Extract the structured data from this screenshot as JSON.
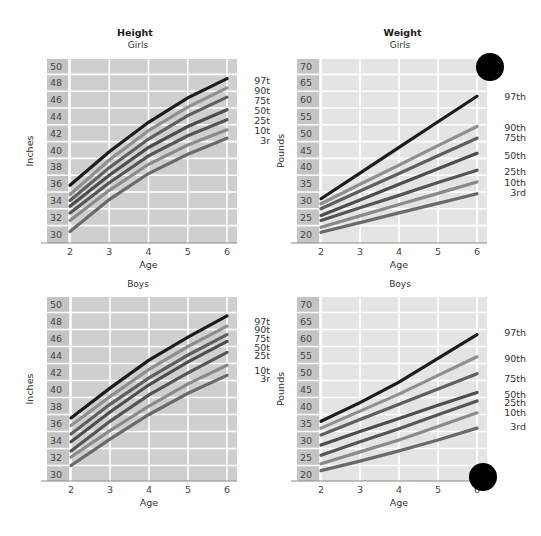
{
  "headers": {
    "height_title": "Height",
    "weight_title": "Weight"
  },
  "chart_data": [
    {
      "id": "girls-height",
      "type": "line",
      "title": "Height",
      "subtitle": "Girls",
      "xlabel": "Age",
      "ylabel": "Inches",
      "x": [
        2,
        3,
        4,
        5,
        6
      ],
      "xticks": [
        2,
        3,
        4,
        5,
        6
      ],
      "yticks": [
        30,
        32,
        34,
        36,
        38,
        40,
        42,
        44,
        46,
        48,
        50
      ],
      "ylim": [
        30,
        50
      ],
      "xlim": [
        2,
        6
      ],
      "grid": true,
      "legend_position": "right",
      "bg": "#cfcfcf",
      "series": [
        {
          "name": "97th",
          "values": [
            35.8,
            39.8,
            43.3,
            46.2,
            48.5
          ],
          "color": "#1c1c1c"
        },
        {
          "name": "90th",
          "values": [
            34.7,
            38.8,
            42.3,
            45.1,
            47.4
          ],
          "color": "#8f8f8f"
        },
        {
          "name": "75th",
          "values": [
            34.0,
            37.9,
            41.3,
            44.1,
            46.3
          ],
          "color": "#5f5f5f"
        },
        {
          "name": "50th",
          "values": [
            33.3,
            37.0,
            40.3,
            42.8,
            44.8
          ],
          "color": "#4d4d4d"
        },
        {
          "name": "25th",
          "values": [
            32.5,
            36.1,
            39.3,
            41.7,
            43.6
          ],
          "color": "#555555"
        },
        {
          "name": "10th",
          "values": [
            31.6,
            35.2,
            38.3,
            40.6,
            42.4
          ],
          "color": "#8a8a8a"
        },
        {
          "name": "3rd",
          "values": [
            30.3,
            34.1,
            37.2,
            39.5,
            41.4
          ],
          "color": "#6a6a6a"
        }
      ],
      "legend_label_y": [
        48.3,
        47.1,
        45.9,
        44.7,
        43.5,
        42.3,
        41.1
      ]
    },
    {
      "id": "girls-weight",
      "type": "line",
      "title": "Weight",
      "subtitle": "Girls",
      "xlabel": "Age",
      "ylabel": "Pounds",
      "x": [
        2,
        3,
        4,
        5,
        6
      ],
      "xticks": [
        2,
        3,
        4,
        5,
        6
      ],
      "yticks": [
        20,
        25,
        30,
        35,
        40,
        45,
        50,
        55,
        60,
        65,
        70
      ],
      "ylim": [
        20,
        70
      ],
      "xlim": [
        2,
        6
      ],
      "grid": true,
      "legend_position": "right",
      "bg": "#e4e4e4",
      "series": [
        {
          "name": "97th",
          "values": [
            30.5,
            38.1,
            45.8,
            53.4,
            61.0
          ],
          "color": "#1c1c1c"
        },
        {
          "name": "90th",
          "values": [
            29.0,
            34.8,
            40.5,
            46.3,
            52.0
          ],
          "color": "#8f8f8f"
        },
        {
          "name": "75th",
          "values": [
            27.5,
            32.8,
            38.0,
            43.3,
            48.5
          ],
          "color": "#5f5f5f"
        },
        {
          "name": "50th",
          "values": [
            25.5,
            30.1,
            34.8,
            39.4,
            44.0
          ],
          "color": "#4d4d4d"
        },
        {
          "name": "25th",
          "values": [
            24.0,
            27.8,
            31.5,
            35.3,
            39.0
          ],
          "color": "#555555"
        },
        {
          "name": "10th",
          "values": [
            22.0,
            25.4,
            28.8,
            32.1,
            35.5
          ],
          "color": "#8a8a8a"
        },
        {
          "name": "3rd",
          "values": [
            20.5,
            23.4,
            26.3,
            29.1,
            32.0
          ],
          "color": "#6a6a6a"
        }
      ],
      "legend_label_y": [
        61.0,
        51.6,
        48.6,
        43.4,
        38.6,
        35.4,
        32.4
      ]
    },
    {
      "id": "boys-height",
      "type": "line",
      "title": "",
      "subtitle": "Boys",
      "xlabel": "Age",
      "ylabel": "Inches",
      "x": [
        2,
        3,
        4,
        5,
        6
      ],
      "xticks": [
        2,
        3,
        4,
        5,
        6
      ],
      "yticks": [
        30,
        32,
        34,
        36,
        38,
        40,
        42,
        44,
        46,
        48,
        50
      ],
      "ylim": [
        30,
        50
      ],
      "xlim": [
        2,
        6
      ],
      "grid": true,
      "legend_position": "right",
      "bg": "#cfcfcf",
      "series": [
        {
          "name": "97th",
          "values": [
            36.6,
            40.1,
            43.4,
            46.1,
            48.6
          ],
          "color": "#1c1c1c"
        },
        {
          "name": "90th",
          "values": [
            35.7,
            39.1,
            42.3,
            45.0,
            47.4
          ],
          "color": "#8f8f8f"
        },
        {
          "name": "75th",
          "values": [
            34.7,
            38.2,
            41.3,
            44.0,
            46.4
          ],
          "color": "#5f5f5f"
        },
        {
          "name": "50th",
          "values": [
            33.8,
            37.3,
            40.5,
            43.2,
            45.6
          ],
          "color": "#4d4d4d"
        },
        {
          "name": "25th",
          "values": [
            32.7,
            36.2,
            39.3,
            41.9,
            44.3
          ],
          "color": "#555555"
        },
        {
          "name": "10th",
          "values": [
            32.0,
            35.1,
            38.0,
            40.6,
            42.8
          ],
          "color": "#8a8a8a"
        },
        {
          "name": "3rd",
          "values": [
            31.0,
            34.1,
            37.0,
            39.5,
            41.6
          ],
          "color": "#6a6a6a"
        }
      ],
      "legend_label_y": [
        48.0,
        47.0,
        45.9,
        44.9,
        43.9,
        42.2,
        41.2
      ]
    },
    {
      "id": "boys-weight",
      "type": "line",
      "title": "",
      "subtitle": "Boys",
      "xlabel": "Age",
      "ylabel": "Pounds",
      "x": [
        2,
        3,
        4,
        5,
        6
      ],
      "xticks": [
        2,
        3,
        4,
        5,
        6
      ],
      "yticks": [
        20,
        25,
        30,
        35,
        40,
        45,
        50,
        55,
        60,
        65,
        70
      ],
      "ylim": [
        20,
        70
      ],
      "xlim": [
        2,
        6
      ],
      "grid": true,
      "legend_position": "right",
      "bg": "#e4e4e4",
      "series": [
        {
          "name": "97th",
          "values": [
            35.5,
            41.0,
            47.0,
            54.0,
            61.0
          ],
          "color": "#1c1c1c"
        },
        {
          "name": "90th",
          "values": [
            33.5,
            38.5,
            43.5,
            49.0,
            54.5
          ],
          "color": "#8f8f8f"
        },
        {
          "name": "75th",
          "values": [
            31.5,
            36.0,
            40.5,
            45.0,
            49.5
          ],
          "color": "#5f5f5f"
        },
        {
          "name": "50th",
          "values": [
            28.5,
            32.5,
            36.3,
            40.2,
            44.0
          ],
          "color": "#4d4d4d"
        },
        {
          "name": "25th",
          "values": [
            25.5,
            29.5,
            33.3,
            37.4,
            41.5
          ],
          "color": "#555555"
        },
        {
          "name": "10th",
          "values": [
            23.0,
            26.5,
            30.0,
            34.0,
            38.0
          ],
          "color": "#8a8a8a"
        },
        {
          "name": "3rd",
          "values": [
            21.0,
            23.8,
            26.8,
            30.0,
            33.5
          ],
          "color": "#6a6a6a"
        }
      ],
      "legend_label_y": [
        61.5,
        54.0,
        48.0,
        43.5,
        41.0,
        38.0,
        34.0
      ]
    }
  ],
  "decorations": {
    "dots": [
      {
        "x": 490,
        "y": 67
      },
      {
        "x": 483,
        "y": 477
      }
    ]
  }
}
